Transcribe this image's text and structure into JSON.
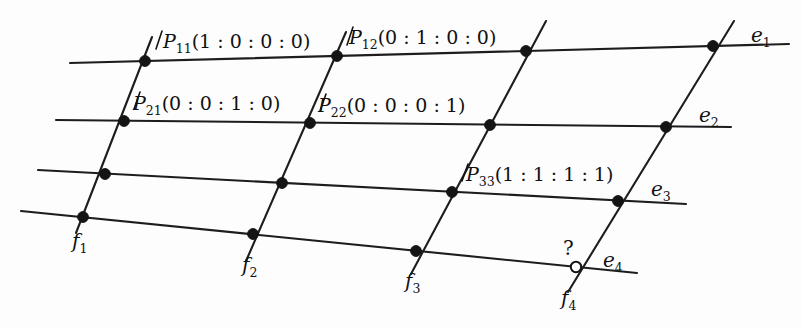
{
  "figure": {
    "background_color": "#fdfdfd",
    "line_color": "#1d1d1d",
    "node_color": "#141414",
    "open_node_fill": "#ffffff",
    "width": 802,
    "height": 327
  },
  "horizontal_lines": [
    {
      "id": "e1",
      "label": "e",
      "subscript": "1"
    },
    {
      "id": "e2",
      "label": "e",
      "subscript": "2"
    },
    {
      "id": "e3",
      "label": "e",
      "subscript": "3"
    },
    {
      "id": "e4",
      "label": "e",
      "subscript": "4"
    }
  ],
  "oblique_lines": [
    {
      "id": "f1",
      "label": "f",
      "subscript": "1"
    },
    {
      "id": "f2",
      "label": "f",
      "subscript": "2"
    },
    {
      "id": "f3",
      "label": "f",
      "subscript": "3"
    },
    {
      "id": "f4",
      "label": "f",
      "subscript": "4"
    }
  ],
  "point_labels": [
    {
      "id": "P11",
      "name": "P",
      "subscript": "11",
      "coordinates": "(1 : 0 : 0 : 0)",
      "full_text": "P11(1 : 0 : 0 : 0)"
    },
    {
      "id": "P12",
      "name": "P",
      "subscript": "12",
      "coordinates": "(0 : 1 : 0 : 0)",
      "full_text": "P12(0 : 1 : 0 : 0)"
    },
    {
      "id": "P21",
      "name": "P",
      "subscript": "21",
      "coordinates": "(0 : 0 : 1 : 0)",
      "full_text": "P21(0 : 0 : 1 : 0)"
    },
    {
      "id": "P22",
      "name": "P",
      "subscript": "22",
      "coordinates": "(0 : 0 : 0 : 1)",
      "full_text": "P22(0 : 0 : 0 : 1)"
    },
    {
      "id": "P33",
      "name": "P",
      "subscript": "33",
      "coordinates": "(1 : 1 : 1 : 1)",
      "full_text": "P33(1 : 1 : 1 : 1)"
    }
  ],
  "unknown_point": {
    "marker": "?",
    "style": "open-circle",
    "on_lines": "f4 and e4"
  }
}
